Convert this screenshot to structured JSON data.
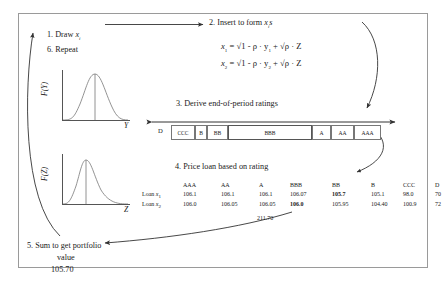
{
  "diagram": {
    "steps": {
      "s1": "1. Draw",
      "s1_var": "x",
      "s1_sub": "i",
      "s6": "6. Repeat",
      "s2": "2. Insert to form",
      "s2_var": "x",
      "s2_sub": "i",
      "s2_tail": "s",
      "s3": "3. Derive end-of-period ratings",
      "s4": "4. Price loan based on rating",
      "s5_line1": "5. Sum to get portfolio",
      "s5_line2": "value",
      "s5_line3": "105.70"
    },
    "formulas": [
      {
        "lhs": "x",
        "lhs_sub": "1",
        "rhs": "= √1 - ρ · y",
        "rhs_sub": "1",
        "rhs_tail": "+ √ρ · Z"
      },
      {
        "lhs": "x",
        "lhs_sub": "2",
        "rhs": "= √1 - ρ · y",
        "rhs_sub": "2",
        "rhs_tail": "+ √ρ · Z"
      }
    ],
    "plots": {
      "top": {
        "ylabel": "F(Y)",
        "xlabel": "Y",
        "shape": "symmetric-bell"
      },
      "bottom": {
        "ylabel": "F(Z)",
        "xlabel": "Z",
        "shape": "right-skewed"
      }
    },
    "rating_scale": {
      "left_outside_label": "D",
      "cells": [
        "CCC",
        "B",
        "BB",
        "BBB",
        "A",
        "AA",
        "AAA"
      ],
      "highlighted_cell": "BBB"
    },
    "price_table": {
      "columns": [
        "AAA",
        "AA",
        "A",
        "BBB",
        "BB",
        "B",
        "CCC",
        "D"
      ],
      "rows": [
        {
          "label": "Loan",
          "label_var": "x",
          "label_sub": "1",
          "values": [
            "106.1",
            "106.1",
            "106.1",
            "106.07",
            "105.7",
            "105.1",
            "98.0",
            "70"
          ],
          "bold_index": 4
        },
        {
          "label": "Loan",
          "label_var": "x",
          "label_sub": "2",
          "values": [
            "106.0",
            "106.05",
            "106.05",
            "106.0",
            "105.95",
            "104.40",
            "100.9",
            "72"
          ],
          "bold_index": 3
        }
      ],
      "sum": "211.70"
    },
    "colors": {
      "ink": "#1a1a1a",
      "line": "#555555",
      "frame": "#9a9a9a",
      "cell_border": "#777777"
    }
  }
}
